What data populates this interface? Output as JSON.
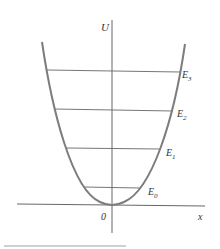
{
  "diagram": {
    "type": "harmonic-oscillator-potential",
    "axes": {
      "y_label": "U",
      "x_label": "x",
      "origin_label": "0"
    },
    "energy_levels": [
      {
        "label": "E",
        "subscript": "0"
      },
      {
        "label": "E",
        "subscript": "1"
      },
      {
        "label": "E",
        "subscript": "2"
      },
      {
        "label": "E",
        "subscript": "3"
      }
    ],
    "colors": {
      "curve": "#7a7a7a",
      "lines": "#6a6a6a",
      "axis": "#555555",
      "footer_bar": "#d0d0d0"
    }
  }
}
